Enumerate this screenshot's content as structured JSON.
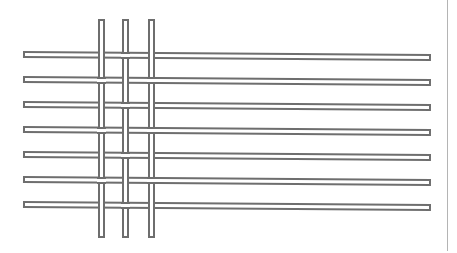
{
  "diagram": {
    "type": "woven-grid",
    "colors": {
      "stroke": "#6e6e6e",
      "fill": "#ffffff",
      "divider": "#b4b4b4",
      "background": "#ffffff"
    },
    "horizontal_strips": {
      "count": 7,
      "left_x": 23,
      "width": 408,
      "height": 7,
      "tops_y": [
        51,
        76,
        101,
        126,
        151,
        176,
        201
      ],
      "slant_deg": 0.42
    },
    "vertical_strips": {
      "count": 3,
      "lefts_x": [
        98,
        122,
        148
      ],
      "top_y": 19,
      "height": 219,
      "width": 7
    },
    "weave_pattern": [
      [
        "V",
        "H",
        "V"
      ],
      [
        "H",
        "V",
        "H"
      ],
      [
        "V",
        "H",
        "V"
      ],
      [
        "H",
        "V",
        "H"
      ],
      [
        "V",
        "H",
        "V"
      ],
      [
        "H",
        "V",
        "H"
      ],
      [
        "V",
        "H",
        "V"
      ]
    ],
    "weave_legend": {
      "V": "vertical strip on top",
      "H": "horizontal strip on top"
    }
  }
}
